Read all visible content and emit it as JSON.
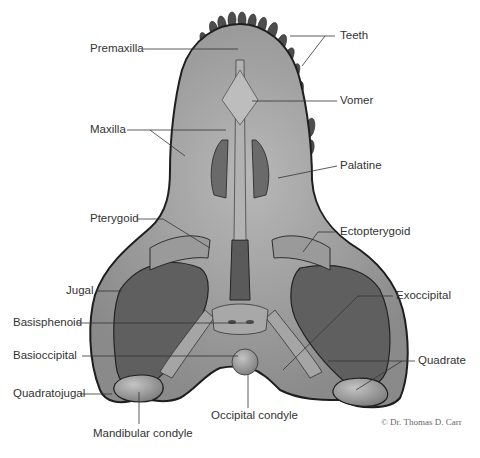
{
  "figure": {
    "credit": "© Dr. Thomas D. Carr"
  },
  "labels": {
    "premaxilla": "Premaxilla",
    "teeth": "Teeth",
    "vomer": "Vomer",
    "maxilla": "Maxilla",
    "palatine": "Palatine",
    "pterygoid": "Pterygoid",
    "ectopterygoid": "Ectopterygoid",
    "jugal": "Jugal",
    "exoccipital": "Exoccipital",
    "basisphenoid": "Basisphenoid",
    "basioccipital": "Basioccipital",
    "quadrate": "Quadrate",
    "quadratojugal": "Quadratojugal",
    "occipital_condyle": "Occipital condyle",
    "mandibular_condyle": "Mandibular condyle"
  },
  "colors": {
    "bone_light": "#a8a8a8",
    "bone_mid": "#8c8c8c",
    "fenestra_dark": "#5e5e5e",
    "teeth_dark": "#4a4a4a",
    "outline": "#222222",
    "leader_line": "#333333"
  }
}
